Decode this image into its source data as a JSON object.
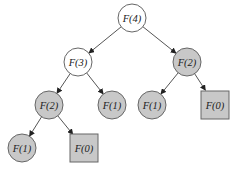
{
  "diagram": {
    "type": "recursion-tree",
    "colors": {
      "white_fill": "#ffffff",
      "gray_fill": "#c8c8c8",
      "stroke": "#666666",
      "edge": "#555555"
    },
    "nodes": [
      {
        "id": "n1",
        "label": "F(4)",
        "shape": "circle",
        "fill": "white",
        "x": 132,
        "y": 18
      },
      {
        "id": "n2",
        "label": "F(3)",
        "shape": "circle",
        "fill": "white",
        "x": 78,
        "y": 62
      },
      {
        "id": "n3",
        "label": "F(2)",
        "shape": "circle",
        "fill": "gray",
        "x": 187,
        "y": 62
      },
      {
        "id": "n4",
        "label": "F(2)",
        "shape": "circle",
        "fill": "gray",
        "x": 49,
        "y": 105
      },
      {
        "id": "n5",
        "label": "F(1)",
        "shape": "circle",
        "fill": "gray",
        "x": 112,
        "y": 105
      },
      {
        "id": "n6",
        "label": "F(1)",
        "shape": "circle",
        "fill": "gray",
        "x": 152,
        "y": 105
      },
      {
        "id": "n7",
        "label": "F(0)",
        "shape": "square",
        "fill": "gray",
        "x": 215,
        "y": 105
      },
      {
        "id": "n8",
        "label": "F(1)",
        "shape": "circle",
        "fill": "gray",
        "x": 22,
        "y": 148
      },
      {
        "id": "n9",
        "label": "F(0)",
        "shape": "square",
        "fill": "gray",
        "x": 84,
        "y": 148
      }
    ],
    "edges": [
      {
        "from": "n1",
        "to": "n2"
      },
      {
        "from": "n1",
        "to": "n3"
      },
      {
        "from": "n2",
        "to": "n4"
      },
      {
        "from": "n2",
        "to": "n5"
      },
      {
        "from": "n3",
        "to": "n6"
      },
      {
        "from": "n3",
        "to": "n7"
      },
      {
        "from": "n4",
        "to": "n8"
      },
      {
        "from": "n4",
        "to": "n9"
      }
    ]
  }
}
